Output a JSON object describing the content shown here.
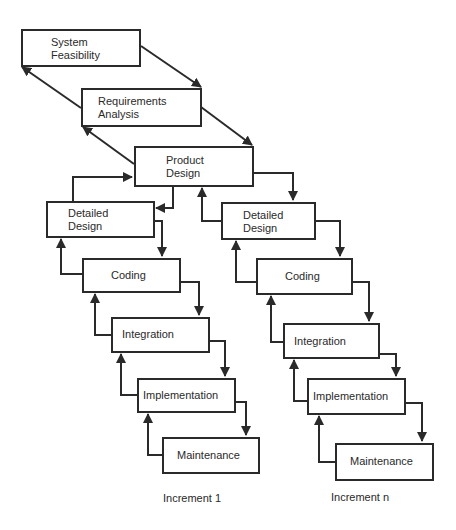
{
  "diagram": {
    "type": "incremental-waterfall-process",
    "shared_stages": [
      {
        "id": "system-feasibility",
        "label": "System\nFeasibility"
      },
      {
        "id": "requirements-analysis",
        "label": "Requirements\nAnalysis"
      },
      {
        "id": "product-design",
        "label": "Product\nDesign"
      }
    ],
    "increments": [
      {
        "caption": "Increment 1",
        "stages": [
          {
            "id": "detailed-design",
            "label": "Detailed\nDesign"
          },
          {
            "id": "coding",
            "label": "Coding"
          },
          {
            "id": "integration",
            "label": "Integration"
          },
          {
            "id": "implementation",
            "label": "Implementation"
          },
          {
            "id": "maintenance",
            "label": "Maintenance"
          }
        ]
      },
      {
        "caption": "Increment n",
        "stages": [
          {
            "id": "detailed-design",
            "label": "Detailed\nDesign"
          },
          {
            "id": "coding",
            "label": "Coding"
          },
          {
            "id": "integration",
            "label": "Integration"
          },
          {
            "id": "implementation",
            "label": "Implementation"
          },
          {
            "id": "maintenance",
            "label": "Maintenance"
          }
        ]
      }
    ],
    "edges": [
      {
        "from": "System Feasibility",
        "to": "Requirements Analysis",
        "direction": "forward"
      },
      {
        "from": "Requirements Analysis",
        "to": "System Feasibility",
        "direction": "feedback"
      },
      {
        "from": "Requirements Analysis",
        "to": "Product Design",
        "direction": "forward"
      },
      {
        "from": "Product Design",
        "to": "Requirements Analysis",
        "direction": "feedback"
      },
      {
        "from": "Product Design",
        "to": "Detailed Design (Increment 1)",
        "direction": "forward"
      },
      {
        "from": "Detailed Design (Increment 1)",
        "to": "Product Design",
        "direction": "feedback"
      },
      {
        "from": "Product Design",
        "to": "Detailed Design (Increment n)",
        "direction": "forward"
      },
      {
        "from": "Detailed Design (Increment n)",
        "to": "Product Design",
        "direction": "feedback"
      },
      {
        "from": "Detailed Design",
        "to": "Coding",
        "direction": "forward"
      },
      {
        "from": "Coding",
        "to": "Detailed Design",
        "direction": "feedback"
      },
      {
        "from": "Coding",
        "to": "Integration",
        "direction": "forward"
      },
      {
        "from": "Integration",
        "to": "Coding",
        "direction": "feedback"
      },
      {
        "from": "Integration",
        "to": "Implementation",
        "direction": "forward"
      },
      {
        "from": "Implementation",
        "to": "Integration",
        "direction": "feedback"
      },
      {
        "from": "Implementation",
        "to": "Maintenance",
        "direction": "forward"
      },
      {
        "from": "Maintenance",
        "to": "Implementation",
        "direction": "feedback"
      }
    ]
  },
  "colors": {
    "line": "#2a2a2a",
    "background": "#ffffff"
  }
}
